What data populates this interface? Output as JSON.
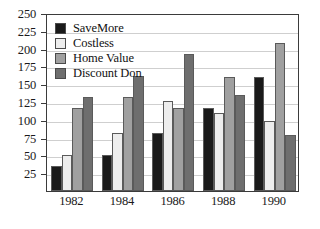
{
  "chart_data": {
    "type": "bar",
    "title": "",
    "xlabel": "",
    "ylabel": "",
    "categories": [
      "1982",
      "1984",
      "1986",
      "1988",
      "1990"
    ],
    "series": [
      {
        "name": "SaveMore",
        "color": "#1a1a1a",
        "values": [
          35,
          50,
          81,
          116,
          160
        ]
      },
      {
        "name": "Costless",
        "color": "#ededed",
        "values": [
          50,
          81,
          126,
          110,
          99
        ]
      },
      {
        "name": "Home Value",
        "color": "#a0a0a0",
        "values": [
          117,
          132,
          116,
          160,
          208
        ]
      },
      {
        "name": "Discount Don",
        "color": "#6e6e6e",
        "values": [
          132,
          161,
          192,
          135,
          79
        ]
      }
    ],
    "ylim": [
      0,
      250
    ],
    "yticks": [
      25,
      50,
      75,
      100,
      125,
      150,
      175,
      200,
      225,
      250
    ],
    "ytick_labels": [
      "25",
      "50",
      "75",
      "100",
      "125",
      "150",
      "175",
      "200",
      "225",
      "250"
    ],
    "grid": true,
    "legend_position": "top-left",
    "plot_border_color": "#3b3b3b",
    "gridline_color": "#cfcfcf",
    "background_color": "#ffffff"
  }
}
